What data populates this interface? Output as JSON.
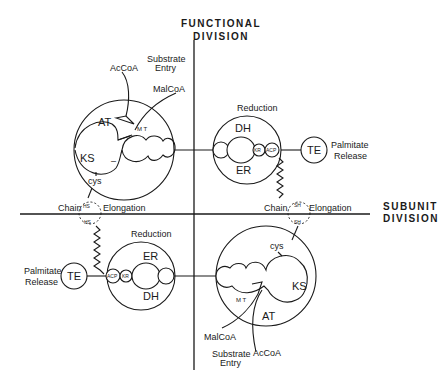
{
  "axes": {
    "vertical_label_line1": "FUNCTIONAL",
    "vertical_label_line2": "DIVISION",
    "horizontal_label_line1": "SUBUNIT",
    "horizontal_label_line2": "DIVISION"
  },
  "upper_left": {
    "substrate_entry_line1": "Substrate",
    "substrate_entry_line2": "Entry",
    "accoa": "AcCoA",
    "malcoa": "MalCoA",
    "at": "AT",
    "mt": "M T",
    "ks": "KS",
    "minus": "–",
    "cys": "cys",
    "hs": "HS",
    "hs2": "HS"
  },
  "upper_right": {
    "reduction": "Reduction",
    "dh": "DH",
    "er": "ER",
    "kr": "KR",
    "acp": "ACP",
    "te": "TE",
    "palmitate_line1": "Palmitate",
    "palmitate_line2": "Release",
    "sh": "SH",
    "sh2": "SH"
  },
  "chain_elongation": {
    "left_chain": "Chain",
    "left_elongation": "Elongation",
    "right_chain": "Chain",
    "right_elongation": "Elongation"
  },
  "lower_left": {
    "reduction": "Reduction",
    "er": "ER",
    "dh": "DH",
    "kr": "KR",
    "acp": "ACP",
    "te": "TE",
    "palmitate_line1": "Palmitate",
    "palmitate_line2": "Release"
  },
  "lower_right": {
    "cys": "cys",
    "ks": "KS",
    "mt": "M T",
    "at": "AT",
    "malcoa": "MalCoA",
    "accoa": "AcCoA",
    "substrate_entry_line1": "Substrate",
    "substrate_entry_line2": "Entry"
  }
}
